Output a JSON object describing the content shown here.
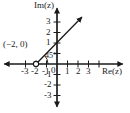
{
  "figure": {
    "type": "complex-plane-ray-diagram",
    "axes": {
      "x_label": "Re(z)",
      "y_label": "Im(z)",
      "x_ticks": [
        "-3",
        "-2",
        "-1",
        "1",
        "2",
        "3"
      ],
      "y_ticks": [
        "3",
        "2",
        "1",
        "-1",
        "-2",
        "-3"
      ],
      "origin_label": "0",
      "x_range": [
        -3.6,
        3.6
      ],
      "y_range": [
        -3.6,
        3.6
      ],
      "grid": false,
      "arrowheads": [
        "left",
        "right",
        "up",
        "down"
      ]
    },
    "annotations": {
      "point_label": "(−2, 0)",
      "angle_label": "45°"
    },
    "ray": {
      "start_point": [
        -2,
        0
      ],
      "start_marker": "open-circle",
      "angle_degrees": 45,
      "direction": "up-right",
      "end_arrow": true
    },
    "colors": {
      "ink": "#1a1a1a",
      "background": "#ffffff"
    }
  }
}
